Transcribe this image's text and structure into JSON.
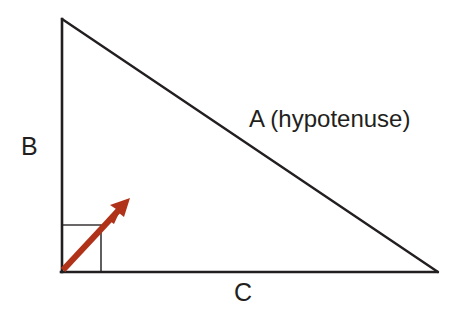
{
  "diagram": {
    "kind": "right-triangle-geometry-diagram",
    "background_color": "#ffffff",
    "stroke_color": "#231f20",
    "arrow_color": "#b03218",
    "labels": {
      "side_b": "B",
      "side_c": "C",
      "side_a": "A (hypotenuse)"
    },
    "geometry": {
      "apex": [
        61,
        18
      ],
      "bottom_left": [
        61,
        272
      ],
      "bottom_right": [
        437,
        272
      ],
      "right_angle_marker": {
        "corner": [
          61,
          272
        ],
        "width": 40,
        "height": 47
      },
      "arrow": {
        "tail": [
          62,
          271
        ],
        "tip": [
          128,
          200
        ]
      }
    },
    "icons": {
      "arrow": "diagonal-arrow-icon",
      "right_angle": "right-angle-marker-icon"
    }
  }
}
